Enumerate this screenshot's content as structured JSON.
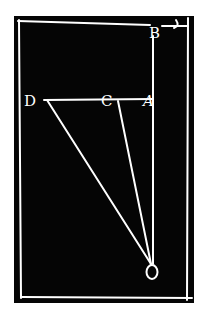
{
  "diagram": {
    "background": "#050505",
    "stroke_color": "#ffffff",
    "panel": {
      "x": 14,
      "y": 16,
      "w": 180,
      "h": 287
    },
    "labels": {
      "B": "B",
      "D": "D",
      "C": "C",
      "A": "A",
      "O": "O"
    },
    "points": {
      "B": [
        155,
        28
      ],
      "D": [
        45,
        100
      ],
      "C": [
        118,
        100
      ],
      "A": [
        152,
        100
      ],
      "O": [
        152,
        264
      ]
    }
  }
}
